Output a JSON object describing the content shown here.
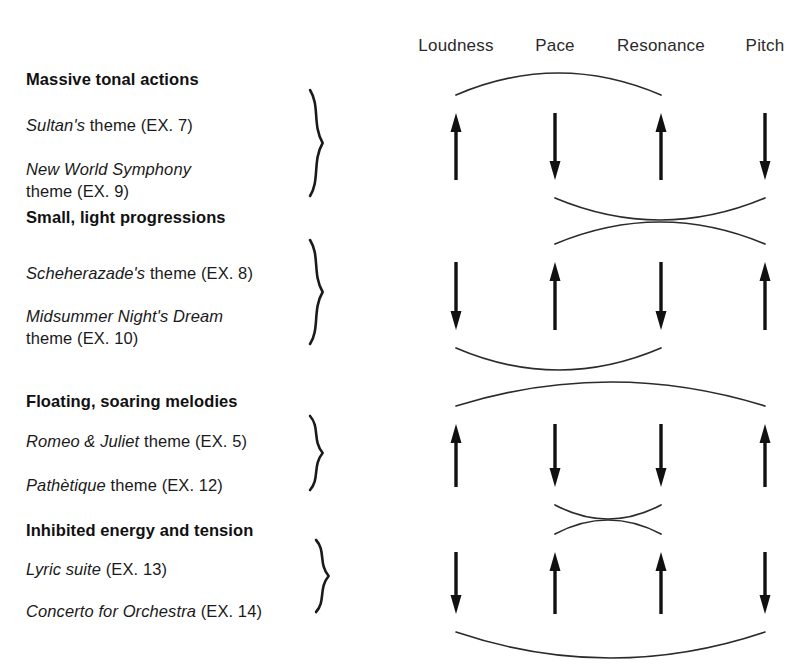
{
  "figure": {
    "columns": [
      {
        "label": "Loudness",
        "x": 456
      },
      {
        "label": "Pace",
        "x": 555
      },
      {
        "label": "Resonance",
        "x": 661
      },
      {
        "label": "Pitch",
        "x": 765
      }
    ],
    "header_y": 36,
    "groups": [
      {
        "id": "massive-tonal-actions",
        "title": "Massive tonal actions",
        "title_y": 70,
        "brace": {
          "x": 315,
          "top": 90,
          "bottom": 196
        },
        "themes": [
          {
            "italic": "Sultan's",
            "rest": " theme (EX. 7)",
            "y": 116,
            "second_line": ""
          },
          {
            "italic": "New World Symphony",
            "rest": "",
            "y": 160,
            "second_line": "theme (EX. 9)"
          }
        ],
        "arrows": [
          {
            "column": "Loudness",
            "direction": "up"
          },
          {
            "column": "Pace",
            "direction": "down"
          },
          {
            "column": "Resonance",
            "direction": "up"
          },
          {
            "column": "Pitch",
            "direction": "down"
          }
        ],
        "arrow_top": 113,
        "arrow_bottom": 180,
        "arcs": [
          {
            "from": "Loudness",
            "to": "Resonance",
            "side": "top",
            "depth": 22
          },
          {
            "from": "Pace",
            "to": "Pitch",
            "side": "bottom",
            "depth": 22
          }
        ]
      },
      {
        "id": "small-light-progressions",
        "title": "Small, light progressions",
        "title_y": 208,
        "brace": {
          "x": 315,
          "top": 240,
          "bottom": 344
        },
        "themes": [
          {
            "italic": "Scheherazade's",
            "rest": " theme (EX. 8)",
            "y": 264,
            "second_line": ""
          },
          {
            "italic": "Midsummer Night's Dream",
            "rest": "",
            "y": 307,
            "second_line": "theme (EX. 10)"
          }
        ],
        "arrows": [
          {
            "column": "Loudness",
            "direction": "down"
          },
          {
            "column": "Pace",
            "direction": "up"
          },
          {
            "column": "Resonance",
            "direction": "down"
          },
          {
            "column": "Pitch",
            "direction": "up"
          }
        ],
        "arrow_top": 262,
        "arrow_bottom": 330,
        "arcs": [
          {
            "from": "Pace",
            "to": "Pitch",
            "side": "top",
            "depth": 22
          },
          {
            "from": "Loudness",
            "to": "Resonance",
            "side": "bottom",
            "depth": 22
          }
        ]
      },
      {
        "id": "floating-soaring-melodies",
        "title": "Floating, soaring melodies",
        "title_y": 392,
        "brace": {
          "x": 315,
          "top": 416,
          "bottom": 490
        },
        "themes": [
          {
            "italic": "Romeo & Juliet",
            "rest": " theme (EX. 5)",
            "y": 432,
            "second_line": ""
          },
          {
            "italic": "Pathètique",
            "rest": " theme (EX. 12)",
            "y": 476,
            "second_line": ""
          }
        ],
        "arrows": [
          {
            "column": "Loudness",
            "direction": "up"
          },
          {
            "column": "Pace",
            "direction": "down"
          },
          {
            "column": "Resonance",
            "direction": "down"
          },
          {
            "column": "Pitch",
            "direction": "up"
          }
        ],
        "arrow_top": 424,
        "arrow_bottom": 487,
        "arcs": [
          {
            "from": "Loudness",
            "to": "Pitch",
            "side": "top",
            "depth": 24
          },
          {
            "from": "Pace",
            "to": "Resonance",
            "side": "bottom",
            "depth": 14
          }
        ]
      },
      {
        "id": "inhibited-energy-and-tension",
        "title": "Inhibited energy and tension",
        "title_y": 521,
        "brace": {
          "x": 321,
          "top": 540,
          "bottom": 612
        },
        "themes": [
          {
            "italic": "Lyric suite",
            "rest": " (EX. 13)",
            "y": 560,
            "second_line": ""
          },
          {
            "italic": "Concerto for Orchestra",
            "rest": " (EX. 14)",
            "y": 602,
            "second_line": ""
          }
        ],
        "arrows": [
          {
            "column": "Loudness",
            "direction": "down"
          },
          {
            "column": "Pace",
            "direction": "up"
          },
          {
            "column": "Resonance",
            "direction": "up"
          },
          {
            "column": "Pitch",
            "direction": "down"
          }
        ],
        "arrow_top": 552,
        "arrow_bottom": 614,
        "arcs": [
          {
            "from": "Pace",
            "to": "Resonance",
            "side": "top",
            "depth": 14
          },
          {
            "from": "Loudness",
            "to": "Pitch",
            "side": "bottom",
            "depth": 26
          }
        ]
      }
    ]
  }
}
